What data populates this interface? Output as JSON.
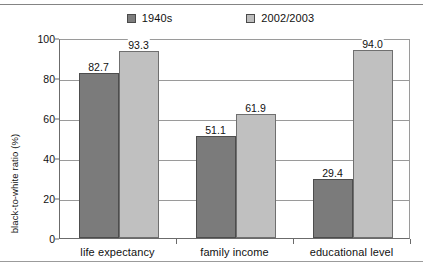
{
  "chart_data": {
    "type": "bar",
    "title": "",
    "xlabel": "",
    "ylabel": "black-to-white ratio (%)",
    "ylim": [
      0,
      100
    ],
    "ytick_labels": [
      "0",
      "20",
      "40",
      "60",
      "80",
      "100"
    ],
    "ytick_values": [
      0,
      20,
      40,
      60,
      80,
      100
    ],
    "grid": true,
    "legend_position": "top-center",
    "categories": [
      "life expectancy",
      "family income",
      "educational level"
    ],
    "series": [
      {
        "name": "1940s",
        "color": "#7b7b7b",
        "values": [
          82.7,
          51.1,
          29.4
        ],
        "labels": [
          "82.7",
          "51.1",
          "29.4"
        ]
      },
      {
        "name": "2002/2003",
        "color": "#c0c0c0",
        "values": [
          93.3,
          61.9,
          94.0
        ],
        "labels": [
          "93.3",
          "61.9",
          "94.0"
        ]
      }
    ]
  }
}
